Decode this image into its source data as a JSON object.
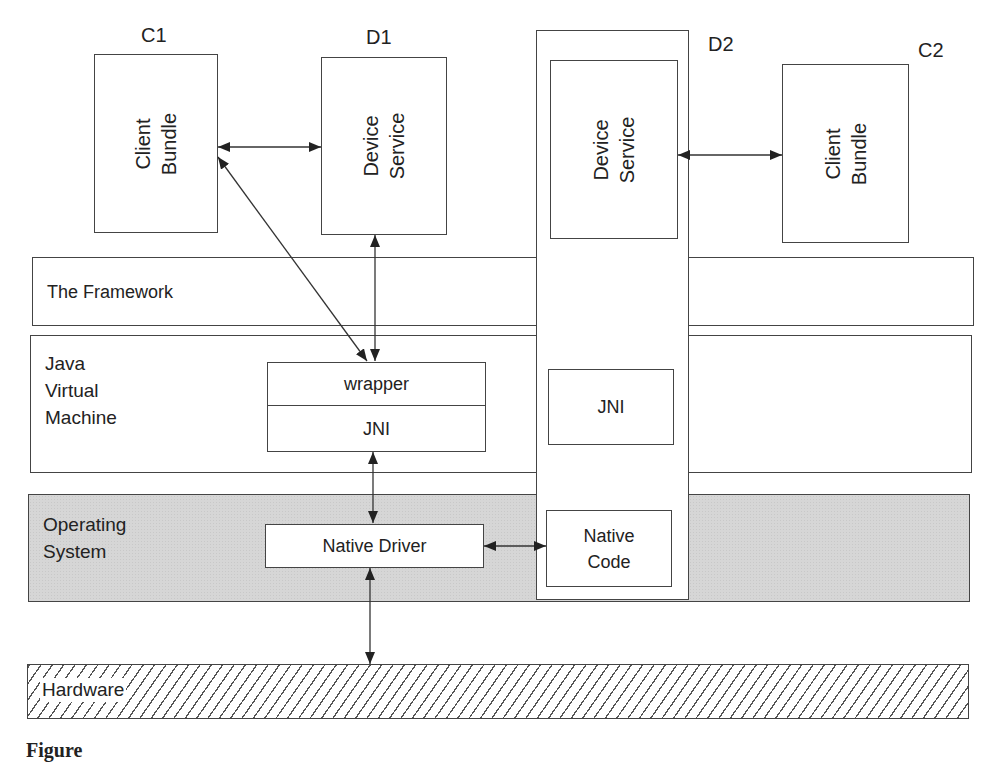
{
  "diagram": {
    "components": {
      "c1": {
        "tag": "C1",
        "label": "Client\nBundle",
        "line1": "Client",
        "line2": "Bundle"
      },
      "d1": {
        "tag": "D1",
        "label": "Device\nService",
        "line1": "Device",
        "line2": "Service"
      },
      "d2": {
        "tag": "D2",
        "label": "Device\nService",
        "line1": "Device",
        "line2": "Service"
      },
      "c2": {
        "tag": "C2",
        "label": "Client\nBundle",
        "line1": "Client",
        "line2": "Bundle"
      }
    },
    "layers": {
      "framework": {
        "label": "The Framework"
      },
      "jvm": {
        "line1": "Java",
        "line2": "Virtual",
        "line3": "Machine"
      },
      "os": {
        "line1": "Operating",
        "line2": "System"
      },
      "hardware": {
        "label": "Hardware"
      }
    },
    "inner_boxes": {
      "wrapper": "wrapper",
      "jni_left": "JNI",
      "jni_right": "JNI",
      "native_driver": "Native Driver",
      "native_code_line1": "Native",
      "native_code_line2": "Code"
    },
    "connections": [
      {
        "from": "C1 Client Bundle",
        "to": "D1 Device Service",
        "type": "bidirectional"
      },
      {
        "from": "C1 Client Bundle",
        "to": "wrapper",
        "type": "bidirectional"
      },
      {
        "from": "D1 Device Service",
        "to": "wrapper",
        "type": "bidirectional"
      },
      {
        "from": "D2 Device Service",
        "to": "C2 Client Bundle",
        "type": "bidirectional"
      },
      {
        "from": "JNI",
        "to": "Native Driver",
        "type": "bidirectional"
      },
      {
        "from": "Native Driver",
        "to": "Native Code",
        "type": "bidirectional"
      },
      {
        "from": "Native Driver",
        "to": "Hardware",
        "type": "bidirectional"
      }
    ],
    "colors": {
      "os_fill": "#d6d6d6",
      "stroke": "#444444"
    },
    "caption": "Figure"
  }
}
